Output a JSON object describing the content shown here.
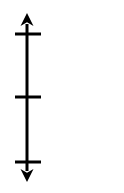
{
  "figure": {
    "name": "vertical-number-line",
    "background_color": "#ffffff",
    "stroke_color": "#000000",
    "canvas": {
      "width": 124,
      "height": 193
    }
  },
  "chart_data": {
    "type": "line",
    "title": "",
    "subtitle": "",
    "xlabel": "",
    "ylabel": "",
    "orientation": "vertical",
    "grid": false,
    "legend": null,
    "axis": {
      "name": "vertical-axis",
      "center_x": 27,
      "top_y": 13,
      "bottom_y": 182,
      "stroke_width": 3,
      "stroke_color": "#000000",
      "arrow_top": true,
      "arrow_bottom": true,
      "arrow_head_width": 13,
      "arrow_head_length": 13
    },
    "ticks": [
      {
        "name": "tick-top",
        "y": 34,
        "x_start": 15,
        "x_end": 41,
        "label": "",
        "stroke_width": 3
      },
      {
        "name": "tick-middle",
        "y": 97,
        "x_start": 15,
        "x_end": 41,
        "label": "",
        "stroke_width": 3
      },
      {
        "name": "tick-bottom",
        "y": 162,
        "x_start": 15,
        "x_end": 41,
        "label": "",
        "stroke_width": 3
      }
    ],
    "tick_labels": [],
    "categories": [],
    "values": [],
    "annotations": []
  }
}
